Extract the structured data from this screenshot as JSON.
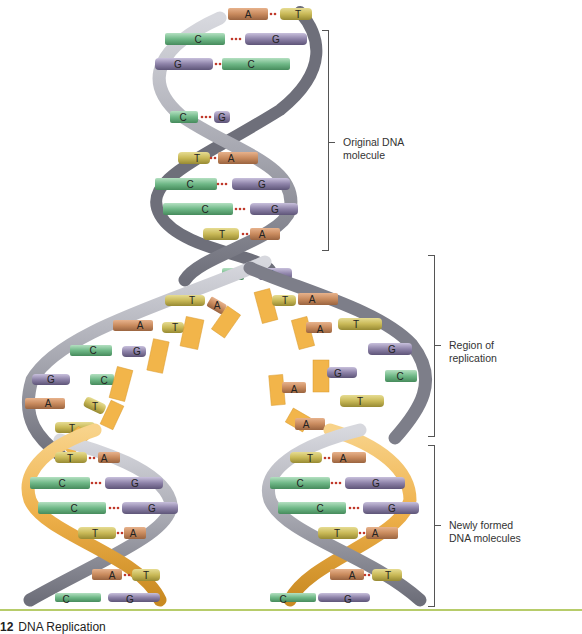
{
  "figure": {
    "caption_number": "12",
    "caption_title": "DNA Replication",
    "colors": {
      "backbone_original": "#a9aab2",
      "backbone_new": "#f0b445",
      "adenine": "#c98b5e",
      "thymine": "#c9b957",
      "cytosine": "#6fb887",
      "guanine": "#8d82a8",
      "hydrogen_bond": "#c0392b",
      "rule": "#b7cc6a"
    },
    "annotations": [
      {
        "id": "original",
        "line1": "Original DNA",
        "line2": "molecule"
      },
      {
        "id": "replication",
        "line1": "Region of",
        "line2": "replication"
      },
      {
        "id": "new",
        "line1": "Newly formed",
        "line2": "DNA molecules"
      }
    ],
    "original_pairs": [
      {
        "left": "A",
        "right": "T"
      },
      {
        "left": "C",
        "right": "G"
      },
      {
        "left": "G",
        "right": "C"
      },
      {
        "left": "C",
        "right": "G"
      },
      {
        "left": "T",
        "right": "A"
      },
      {
        "left": "C",
        "right": "G"
      },
      {
        "left": "C",
        "right": "G"
      },
      {
        "left": "T",
        "right": "A"
      },
      {
        "left": "C",
        "right": "G"
      }
    ],
    "replication_left_bases": [
      "T",
      "A",
      "A",
      "T",
      "C",
      "G",
      "G",
      "C",
      "A",
      "T",
      "T"
    ],
    "replication_right_bases": [
      "T",
      "A",
      "A",
      "T",
      "G",
      "G",
      "C",
      "A",
      "T",
      "A"
    ],
    "new_left_pairs": [
      {
        "left": "T",
        "right": "A"
      },
      {
        "left": "C",
        "right": "G"
      },
      {
        "left": "C",
        "right": "G"
      },
      {
        "left": "T",
        "right": "A"
      },
      {
        "left": "A",
        "right": "T"
      },
      {
        "left": "C",
        "right": "G"
      }
    ],
    "new_right_pairs": [
      {
        "left": "T",
        "right": "A"
      },
      {
        "left": "C",
        "right": "G"
      },
      {
        "left": "C",
        "right": "G"
      },
      {
        "left": "T",
        "right": "A"
      },
      {
        "left": "A",
        "right": "T"
      },
      {
        "left": "C",
        "right": "G"
      }
    ]
  }
}
